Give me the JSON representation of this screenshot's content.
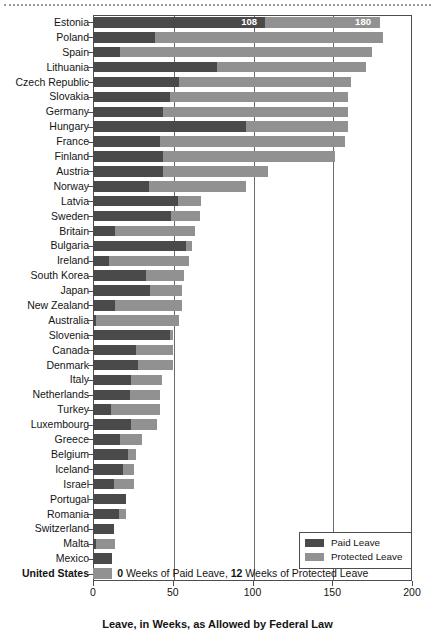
{
  "chart_data": {
    "type": "bar",
    "orientation": "horizontal",
    "stacked": true,
    "title": "",
    "xlabel": "Leave, in Weeks, as Allowed by Federal Law",
    "ylabel": "",
    "xlim": [
      0,
      200
    ],
    "xticks": [
      0,
      50,
      100,
      150,
      200
    ],
    "xtick_labels": [
      "0",
      "50",
      "100",
      "150",
      "200"
    ],
    "grid": "vertical",
    "legend_position": "bottom-right",
    "legend": [
      {
        "name": "Paid Leave",
        "color": "#4a4a4a"
      },
      {
        "name": "Protected Leave",
        "color": "#919191"
      }
    ],
    "series": [
      {
        "name": "Paid Leave",
        "color": "#4a4a4a"
      },
      {
        "name": "Protected Leave",
        "color": "#919191"
      }
    ],
    "categories": [
      "Estonia",
      "Poland",
      "Spain",
      "Lithuania",
      "Czech Republic",
      "Slovakia",
      "Germany",
      "Hungary",
      "France",
      "Finland",
      "Austria",
      "Norway",
      "Latvia",
      "Sweden",
      "Britain",
      "Bulgaria",
      "Ireland",
      "South Korea",
      "Japan",
      "New Zealand",
      "Australia",
      "Slovenia",
      "Canada",
      "Denmark",
      "Italy",
      "Netherlands",
      "Turkey",
      "Luxembourg",
      "Greece",
      "Belgium",
      "Iceland",
      "Israel",
      "Portugal",
      "Romania",
      "Switzerland",
      "Malta",
      "Mexico",
      "United States"
    ],
    "rows": [
      {
        "country": "Estonia",
        "paid": 108,
        "total": 180,
        "label_paid": "108",
        "label_total": "180",
        "bold": false
      },
      {
        "country": "Poland",
        "paid": 39,
        "total": 182,
        "bold": false
      },
      {
        "country": "Spain",
        "paid": 17,
        "total": 175,
        "bold": false
      },
      {
        "country": "Lithuania",
        "paid": 78,
        "total": 171,
        "bold": false
      },
      {
        "country": "Czech Republic",
        "paid": 54,
        "total": 162,
        "bold": false
      },
      {
        "country": "Slovakia",
        "paid": 48,
        "total": 160,
        "bold": false
      },
      {
        "country": "Germany",
        "paid": 44,
        "total": 160,
        "bold": false
      },
      {
        "country": "Hungary",
        "paid": 96,
        "total": 160,
        "bold": false
      },
      {
        "country": "France",
        "paid": 42,
        "total": 158,
        "bold": false
      },
      {
        "country": "Finland",
        "paid": 44,
        "total": 152,
        "bold": false
      },
      {
        "country": "Austria",
        "paid": 44,
        "total": 110,
        "bold": false
      },
      {
        "country": "Norway",
        "paid": 35,
        "total": 96,
        "bold": false
      },
      {
        "country": "Latvia",
        "paid": 53,
        "total": 68,
        "bold": false
      },
      {
        "country": "Sweden",
        "paid": 49,
        "total": 67,
        "bold": false
      },
      {
        "country": "Britain",
        "paid": 14,
        "total": 64,
        "bold": false
      },
      {
        "country": "Bulgaria",
        "paid": 58,
        "total": 62,
        "bold": false
      },
      {
        "country": "Ireland",
        "paid": 10,
        "total": 60,
        "bold": false
      },
      {
        "country": "South Korea",
        "paid": 33,
        "total": 57,
        "bold": false
      },
      {
        "country": "Japan",
        "paid": 36,
        "total": 56,
        "bold": false
      },
      {
        "country": "New Zealand",
        "paid": 14,
        "total": 56,
        "bold": false
      },
      {
        "country": "Australia",
        "paid": 2,
        "total": 54,
        "bold": false
      },
      {
        "country": "Slovenia",
        "paid": 48,
        "total": 50,
        "bold": false
      },
      {
        "country": "Canada",
        "paid": 27,
        "total": 50,
        "bold": false
      },
      {
        "country": "Denmark",
        "paid": 28,
        "total": 50,
        "bold": false
      },
      {
        "country": "Italy",
        "paid": 24,
        "total": 43,
        "bold": false
      },
      {
        "country": "Netherlands",
        "paid": 23,
        "total": 42,
        "bold": false
      },
      {
        "country": "Turkey",
        "paid": 11,
        "total": 42,
        "bold": false
      },
      {
        "country": "Luxembourg",
        "paid": 24,
        "total": 40,
        "bold": false
      },
      {
        "country": "Greece",
        "paid": 17,
        "total": 31,
        "bold": false
      },
      {
        "country": "Belgium",
        "paid": 22,
        "total": 27,
        "bold": false
      },
      {
        "country": "Iceland",
        "paid": 19,
        "total": 26,
        "bold": false
      },
      {
        "country": "Israel",
        "paid": 13,
        "total": 26,
        "bold": false
      },
      {
        "country": "Portugal",
        "paid": 21,
        "total": 21,
        "bold": false
      },
      {
        "country": "Romania",
        "paid": 16,
        "total": 21,
        "bold": false
      },
      {
        "country": "Switzerland",
        "paid": 13,
        "total": 13,
        "bold": false
      },
      {
        "country": "Malta",
        "paid": 2,
        "total": 14,
        "bold": false
      },
      {
        "country": "Mexico",
        "paid": 12,
        "total": 12,
        "bold": false
      },
      {
        "country": "United States",
        "paid": 0,
        "total": 12,
        "bold": true
      }
    ],
    "annotations": [
      {
        "target": "United States",
        "prefix": "0",
        "mid": " Weeks of Paid Leave, ",
        "bold2": "12",
        "suffix": " Weeks of Protected Leave"
      }
    ]
  }
}
